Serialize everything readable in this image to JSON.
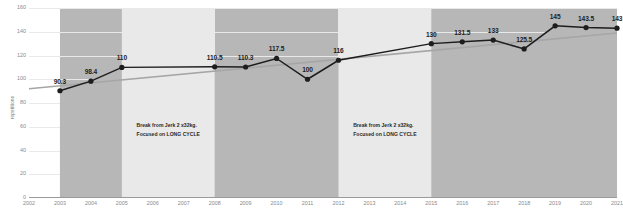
{
  "chart_data": {
    "type": "line",
    "title": "",
    "xlabel": "",
    "ylabel": "repetitions",
    "ylim": [
      0,
      160
    ],
    "xlim": [
      2002,
      2021
    ],
    "grid": true,
    "legend": "none",
    "ytick_labels": [
      "160",
      "140",
      "120",
      "100",
      "80",
      "60",
      "40",
      "20",
      "0"
    ],
    "ytick_values": [
      160,
      140,
      120,
      100,
      80,
      60,
      40,
      20,
      0
    ],
    "xtick_labels": [
      "2002",
      "2003",
      "2004",
      "2005",
      "2006",
      "2007",
      "2008",
      "2009",
      "2010",
      "2011",
      "2012",
      "2013",
      "2014",
      "2015",
      "2016",
      "2017",
      "2018",
      "2019",
      "2020",
      "2021"
    ],
    "series": [
      {
        "name": "repetitions",
        "x": [
          2003,
          2004,
          2005,
          2008,
          2009,
          2010,
          2011,
          2012,
          2015,
          2016,
          2017,
          2018,
          2019,
          2020,
          2021
        ],
        "values": [
          90.3,
          98.4,
          110,
          110.5,
          110.3,
          117.5,
          100,
          116,
          130,
          131.5,
          133,
          125.5,
          145,
          143.5,
          143
        ],
        "labels": [
          "90.3",
          "98.4",
          "110",
          "110.5",
          "110.3",
          "117.5",
          "100",
          "116",
          "130",
          "131.5",
          "133",
          "125.5",
          "145",
          "143.5",
          "143"
        ],
        "marker": "circle",
        "color": "#1d1d1d",
        "fill_color": "#b7b7b7"
      },
      {
        "name": "trendline",
        "x": [
          2002,
          2021
        ],
        "values": [
          92,
          139
        ],
        "color": "#a6a6a6"
      }
    ],
    "bands": [
      {
        "name": "active-period-1",
        "from": 2003,
        "to": 2005,
        "kind": "active",
        "color": "#b7b7b7"
      },
      {
        "name": "break-period-1",
        "from": 2005,
        "to": 2008,
        "kind": "break",
        "color": "#e9e9e9",
        "annotation": [
          "Break from Jerk 2 x32kg.",
          "Focused on LONG CYCLE"
        ]
      },
      {
        "name": "active-period-2",
        "from": 2008,
        "to": 2012,
        "kind": "active",
        "color": "#b7b7b7"
      },
      {
        "name": "break-period-2",
        "from": 2012,
        "to": 2015,
        "kind": "break",
        "color": "#e9e9e9",
        "annotation": [
          "Break from Jerk 2 x32kg.",
          "Focused on LONG CYCLE"
        ]
      },
      {
        "name": "active-period-3",
        "from": 2015,
        "to": 2021,
        "kind": "active",
        "color": "#b7b7b7"
      }
    ],
    "annotations": [
      {
        "line1": "Break from Jerk 2 x32kg.",
        "line2": "Focused on LONG CYCLE",
        "x": 2006.5
      },
      {
        "line1": "Break from Jerk 2 x32kg.",
        "line2": "Focused on LONG CYCLE",
        "x": 2013.5
      }
    ]
  }
}
